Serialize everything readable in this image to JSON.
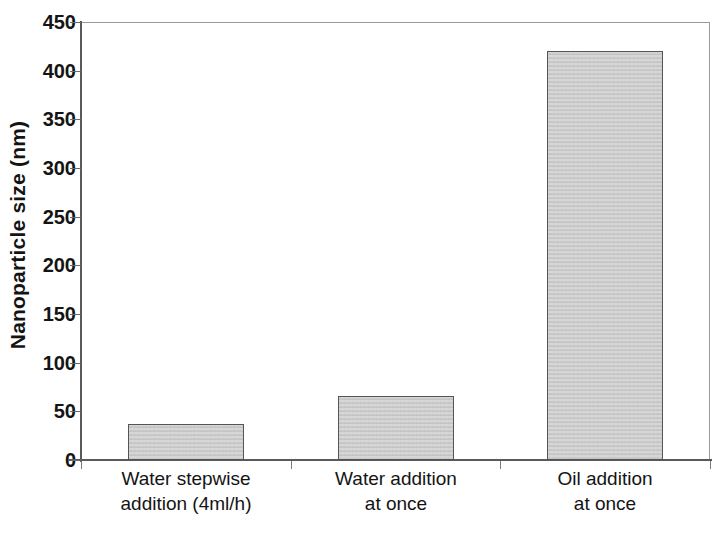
{
  "chart_data": {
    "type": "bar",
    "title": "",
    "subtitle": "",
    "xlabel": "",
    "ylabel": "Nanoparticle size (nm)",
    "categories": [
      "Water stepwise addition (4ml/h)",
      "Water addition at once",
      "Oil addition at once"
    ],
    "category_lines": [
      [
        "Water stepwise",
        "addition (4ml/h)"
      ],
      [
        "Water addition",
        "at once"
      ],
      [
        "Oil addition",
        "at once"
      ]
    ],
    "values": [
      37,
      66,
      420
    ],
    "ylim": [
      0,
      450
    ],
    "ytick_labels": [
      "0",
      "50",
      "100",
      "150",
      "200",
      "250",
      "300",
      "350",
      "400",
      "450"
    ],
    "ytick_values": [
      0,
      50,
      100,
      150,
      200,
      250,
      300,
      350,
      400,
      450
    ],
    "grid": false,
    "legend": false,
    "legend_position": "none",
    "bar_fill_color": "#c9c9c9",
    "bar_edge_color": "#555555",
    "axis_color": "#5a5a5a",
    "background_color": "#ffffff"
  }
}
